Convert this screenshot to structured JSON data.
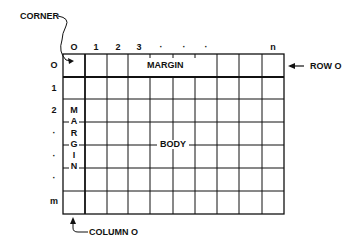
{
  "diagram": {
    "type": "grid-structure",
    "labels": {
      "corner": "CORNER",
      "row0": "ROW O",
      "column0": "COLUMN O",
      "top_margin": "MARGIN",
      "side_margin": [
        "M",
        "A",
        "R",
        "G",
        "I",
        "N"
      ],
      "body": "BODY"
    },
    "column_indices": [
      "O",
      "1",
      "2",
      "3",
      "·",
      "·",
      "·",
      "",
      "",
      "n"
    ],
    "row_indices": [
      "O",
      "1",
      "2",
      "·",
      "·",
      "·",
      "m"
    ],
    "colors": {
      "line": "#111111",
      "background": "#ffffff"
    }
  }
}
